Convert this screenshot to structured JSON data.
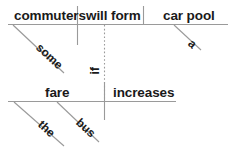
{
  "diagram": {
    "type": "reed-kellogg-sentence-diagram",
    "sentence": "Some commuters will form a car pool if the bus fare increases",
    "ink_color": "#1a1a1a",
    "rule_color": "#9a9a9a",
    "main_clause": {
      "subject": "commuters",
      "verb": "will form",
      "object": "car pool",
      "subject_modifier": "some",
      "object_modifier": "a"
    },
    "subordinate_clause": {
      "subject": "fare",
      "verb": "increases",
      "subject_modifiers": [
        "the",
        "bus"
      ]
    },
    "connector": "if"
  },
  "labels": {
    "commuters": "commuters",
    "will_form": "will form",
    "car_pool": "car pool",
    "some": "some",
    "a": "a",
    "fare": "fare",
    "increases": "increases",
    "the": "the",
    "bus": "bus",
    "if": "if"
  }
}
